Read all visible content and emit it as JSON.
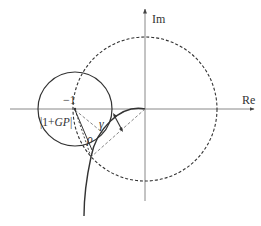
{
  "diagram": {
    "axes": {
      "x_label": "Re",
      "y_label": "Im"
    },
    "labels": {
      "critical_point": "−1",
      "distance": "|1+GP|",
      "distance_plain": "|1+",
      "distance_italic": "GP",
      "distance_end": "|",
      "modulus_margin": "ρ",
      "phase_margin": "γ"
    },
    "elements": [
      {
        "type": "unit-circle",
        "style": "dashed"
      },
      {
        "type": "margin-circle",
        "style": "solid",
        "center": "−1"
      },
      {
        "type": "nyquist-curve",
        "style": "solid"
      },
      {
        "type": "radius-line",
        "style": "dashed"
      }
    ],
    "colors": {
      "stroke": "#333333",
      "axis": "#777777",
      "background": "#ffffff"
    }
  }
}
